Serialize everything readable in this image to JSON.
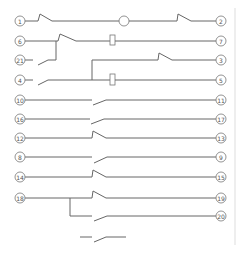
{
  "diagram": {
    "type": "relay-contact-wiring",
    "terminals_left": [
      "1",
      "6",
      "21",
      "4",
      "10",
      "16",
      "12",
      "8",
      "14",
      "18"
    ],
    "terminals_right": [
      "2",
      "7",
      "3",
      "5",
      "11",
      "17",
      "13",
      "9",
      "15",
      "19",
      "20"
    ],
    "labels": {
      "t1": "1",
      "t2": "2",
      "t6": "6",
      "t7": "7",
      "t21": "21",
      "t3": "3",
      "t4": "4",
      "t5": "5",
      "t10": "10",
      "t11": "11",
      "t16": "16",
      "t17": "17",
      "t12": "12",
      "t13": "13",
      "t8": "8",
      "t9": "9",
      "t14": "14",
      "t15": "15",
      "t18": "18",
      "t19": "19",
      "t20": "20"
    },
    "legend_symbol": "normally-open contact"
  }
}
